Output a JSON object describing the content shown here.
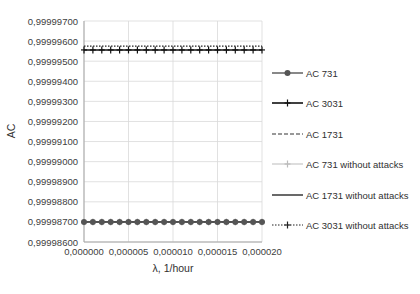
{
  "chart_data": {
    "type": "line",
    "title": "",
    "xlabel": "λ, 1/hour",
    "ylabel": "AC",
    "xlim": [
      0,
      2e-05
    ],
    "ylim": [
      0.999986,
      0.999997
    ],
    "grid": true,
    "legend_position": "right",
    "x_tick_labels": [
      "0,000000",
      "0,000005",
      "0,000010",
      "0,000015",
      "0,000020"
    ],
    "x_ticks": [
      0,
      5e-06,
      1e-05,
      1.5e-05,
      2e-05
    ],
    "y_tick_labels": [
      "0,99998600",
      "0,99998700",
      "0,99998800",
      "0,99998900",
      "0,99999000",
      "0,99999100",
      "0,99999200",
      "0,99999300",
      "0,99999400",
      "0,99999500",
      "0,99999600",
      "0,99999700"
    ],
    "y_ticks": [
      0.999986,
      0.999987,
      0.999988,
      0.999989,
      0.99999,
      0.999991,
      0.999992,
      0.999993,
      0.999994,
      0.999995,
      0.999996,
      0.999997
    ],
    "x": [
      0,
      1e-06,
      2e-06,
      3e-06,
      4e-06,
      5e-06,
      6e-06,
      7e-06,
      8e-06,
      9e-06,
      1e-05,
      1.1e-05,
      1.2e-05,
      1.3e-05,
      1.4e-05,
      1.5e-05,
      1.6e-05,
      1.7e-05,
      1.8e-05,
      1.9e-05,
      2e-05
    ],
    "series": [
      {
        "name": "AC 731",
        "style": "solid-circle-marker",
        "color": "#555555",
        "values": [
          0.999987,
          0.999987,
          0.999987,
          0.999987,
          0.999987,
          0.999987,
          0.999987,
          0.999987,
          0.999987,
          0.999987,
          0.999987,
          0.999987,
          0.999987,
          0.999987,
          0.999987,
          0.999987,
          0.999987,
          0.999987,
          0.999987,
          0.999987,
          0.999987
        ]
      },
      {
        "name": "AC 3031",
        "style": "solid-plus-marker",
        "color": "#111111",
        "values": [
          0.99999556,
          0.99999556,
          0.99999556,
          0.99999556,
          0.99999556,
          0.99999556,
          0.99999556,
          0.99999556,
          0.99999556,
          0.99999556,
          0.99999556,
          0.99999556,
          0.99999556,
          0.99999556,
          0.99999556,
          0.99999556,
          0.99999556,
          0.99999556,
          0.99999556,
          0.99999556,
          0.99999556
        ]
      },
      {
        "name": "AC 1731",
        "style": "dashed",
        "color": "#333333",
        "values": [
          0.999987,
          0.999987,
          0.999987,
          0.999987,
          0.999987,
          0.999987,
          0.999987,
          0.999987,
          0.999987,
          0.999987,
          0.999987,
          0.999987,
          0.999987,
          0.999987,
          0.999987,
          0.999987,
          0.999987,
          0.999987,
          0.999987,
          0.999987,
          0.999987
        ]
      },
      {
        "name": "AC 731 without attacks",
        "style": "light-solid-plus-marker",
        "color": "#bbbbbb",
        "values": [
          0.999987,
          0.999987,
          0.999987,
          0.999987,
          0.999987,
          0.999987,
          0.999987,
          0.999987,
          0.999987,
          0.999987,
          0.999987,
          0.999987,
          0.999987,
          0.999987,
          0.999987,
          0.999987,
          0.999987,
          0.999987,
          0.999987,
          0.999987,
          0.999987
        ]
      },
      {
        "name": "AC 1731 without attacks",
        "style": "solid",
        "color": "#444444",
        "values": [
          0.999987,
          0.999987,
          0.999987,
          0.999987,
          0.999987,
          0.999987,
          0.999987,
          0.999987,
          0.999987,
          0.999987,
          0.999987,
          0.999987,
          0.999987,
          0.999987,
          0.999987,
          0.999987,
          0.999987,
          0.999987,
          0.999987,
          0.999987,
          0.999987
        ]
      },
      {
        "name": "AC 3031 without attacks",
        "style": "dotted-plus-marker",
        "color": "#222222",
        "values": [
          0.99999575,
          0.99999575,
          0.99999575,
          0.99999575,
          0.99999575,
          0.99999575,
          0.99999575,
          0.99999575,
          0.99999575,
          0.99999575,
          0.99999575,
          0.99999575,
          0.99999575,
          0.99999575,
          0.99999575,
          0.99999575,
          0.99999575,
          0.99999575,
          0.99999575,
          0.99999575,
          0.99999575
        ]
      }
    ]
  },
  "colors": {
    "grid": "#d9d9d9",
    "axis": "#a6a6a6",
    "text": "#404040"
  }
}
